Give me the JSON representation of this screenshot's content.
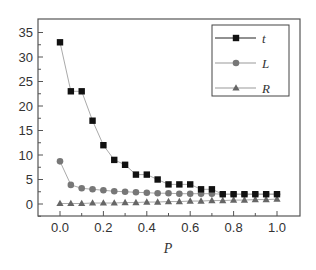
{
  "chart_data": {
    "type": "line",
    "title": "",
    "xlabel": "P",
    "ylabel": "",
    "xlim": [
      -0.09,
      1.1
    ],
    "ylim": [
      -2.5,
      37.5
    ],
    "xticks": [
      "0.0",
      "0.2",
      "0.4",
      "0.6",
      "0.8",
      "1.0"
    ],
    "yticks": [
      "0",
      "5",
      "10",
      "15",
      "20",
      "25",
      "30",
      "35"
    ],
    "grid": false,
    "legend_position": "upper right",
    "x": [
      0.0,
      0.05,
      0.1,
      0.15,
      0.2,
      0.25,
      0.3,
      0.35,
      0.4,
      0.45,
      0.5,
      0.55,
      0.6,
      0.65,
      0.7,
      0.75,
      0.8,
      0.85,
      0.9,
      0.95,
      1.0
    ],
    "series": [
      {
        "name": "t",
        "marker": "square",
        "color": "#111111",
        "values": [
          33,
          23,
          23,
          17,
          12,
          9,
          8,
          6,
          6,
          5,
          4,
          4,
          4,
          3,
          3,
          2,
          2,
          2,
          2,
          2,
          2
        ]
      },
      {
        "name": "L",
        "marker": "circle",
        "color": "#777777",
        "values": [
          8.7,
          3.9,
          3.2,
          3.0,
          2.8,
          2.6,
          2.5,
          2.4,
          2.3,
          2.2,
          2.2,
          2.1,
          2.1,
          2.1,
          2.1,
          2.0,
          2.0,
          2.0,
          2.0,
          2.0,
          2.0
        ]
      },
      {
        "name": "R",
        "marker": "triangle",
        "color": "#666666",
        "values": [
          0.1,
          0.1,
          0.1,
          0.2,
          0.2,
          0.2,
          0.3,
          0.3,
          0.4,
          0.4,
          0.5,
          0.5,
          0.6,
          0.6,
          0.7,
          0.7,
          0.8,
          0.8,
          0.9,
          0.9,
          1.0
        ]
      }
    ]
  }
}
